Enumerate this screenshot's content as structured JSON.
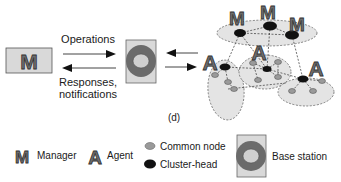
{
  "diagram": {
    "panel_label": "(d)",
    "left_manager_glyph": "M",
    "arrows": {
      "top_label": "Operations",
      "bottom_label_line1": "Responses,",
      "bottom_label_line2": "notifications"
    },
    "network": {
      "manager_glyphs": [
        "M",
        "M",
        "M"
      ],
      "agent_glyphs": [
        "A",
        "A",
        "A"
      ]
    }
  },
  "legend": {
    "manager": {
      "glyph": "M",
      "label": "Manager"
    },
    "agent": {
      "glyph": "A",
      "label": "Agent"
    },
    "common_node": {
      "label": "Common node"
    },
    "cluster_head": {
      "label": "Cluster-head"
    },
    "base_station": {
      "label": "Base station"
    }
  },
  "colors": {
    "glyph_fill": "#6e6e6e",
    "box_fill": "#d9d9d9",
    "ring": "#6b6b6b",
    "ring_inner": "#d0d0d0",
    "cluster_fill": "#e4e4e4",
    "common_node": "#9a9a9a",
    "cluster_head": "#111111"
  }
}
